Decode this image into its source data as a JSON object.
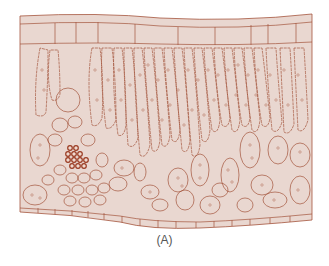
{
  "figure": {
    "caption": "(A)",
    "colors": {
      "background": "#ffffff",
      "tissue_fill": "#e9d7d0",
      "cell_wall": "#a4543c",
      "chloroplast": "#b06a55",
      "xylem": "#9a3b22",
      "caption_text": "#555555"
    },
    "layers": [
      "upper-epidermis",
      "palisade-mesophyll",
      "spongy-mesophyll",
      "vascular-bundle",
      "lower-epidermis"
    ]
  }
}
